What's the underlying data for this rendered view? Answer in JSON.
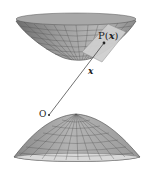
{
  "diagram": {
    "labels": {
      "point": "P(",
      "point_var": "x",
      "point_close": ")",
      "vector": "x",
      "origin": "O"
    },
    "colors": {
      "surface_fill": "#9a9a9a",
      "surface_light": "#c8c8c8",
      "grid_line": "#555555",
      "plane_fill": "#cfcfcf",
      "line": "#333333"
    }
  }
}
